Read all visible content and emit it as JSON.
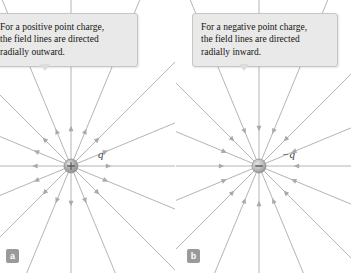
{
  "figure": {
    "background_color": "#ffffff",
    "width": 351,
    "height": 273
  },
  "panels": [
    {
      "id": "a",
      "badge_label": "a",
      "callout": {
        "lines": [
          "For a positive point charge,",
          "the field lines are directed",
          "radially outward."
        ],
        "background_color": "#e9e9e9",
        "border_color": "#c6c6c6",
        "text_color": "#16140f"
      },
      "charge": {
        "sign": "+",
        "sign_glyph": "+",
        "label": "q",
        "center_x": 71,
        "center_y": 166,
        "radius": 7,
        "fill_color": "#a8a8a8",
        "field_direction": "outward"
      }
    },
    {
      "id": "b",
      "badge_label": "b",
      "callout": {
        "lines": [
          "For a negative point charge,",
          "the field lines are directed",
          "radially inward."
        ],
        "background_color": "#e9e9e9",
        "border_color": "#c6c6c6",
        "text_color": "#16140f"
      },
      "charge": {
        "sign": "-",
        "sign_glyph": "−",
        "label": "−q",
        "center_x": 83,
        "center_y": 166,
        "radius": 7,
        "fill_color": "#bdbdbd",
        "field_direction": "inward"
      }
    }
  ],
  "field_lines": {
    "count": 16,
    "angle_step_degrees": 22.5,
    "line_color": "#b4b4b4",
    "arrow_color": "#a9a9a9",
    "line_width": 1,
    "description": "Radial electric field lines emanating from a point charge with mid-line arrowheads"
  }
}
